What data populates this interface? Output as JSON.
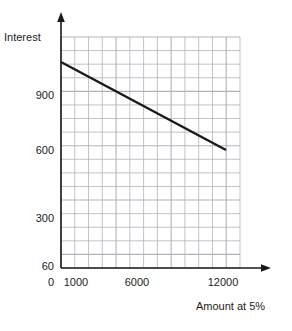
{
  "chart_data": {
    "type": "line",
    "title": "",
    "xlabel": "Amount at 5%",
    "ylabel": "Interest",
    "xlim": [
      0,
      13000
    ],
    "ylim": [
      0,
      1200
    ],
    "grid": true,
    "legend": false,
    "x_ticks": [
      {
        "value": 0,
        "label": "0"
      },
      {
        "value": 1000,
        "label": "1000"
      },
      {
        "value": 6000,
        "label": "6000"
      },
      {
        "value": 12000,
        "label": "12000"
      }
    ],
    "y_ticks": [
      {
        "value": 900,
        "label": "900"
      },
      {
        "value": 600,
        "label": "600"
      },
      {
        "value": 300,
        "label": "300"
      },
      {
        "value": 60,
        "label": "60"
      }
    ],
    "series": [
      {
        "name": "Interest vs Amount",
        "color": "#1a1a1a",
        "x": [
          0,
          12000
        ],
        "values": [
          1080,
          600
        ]
      }
    ],
    "grid_color": "#b2b2bb",
    "axis_color": "#1a1a1a"
  },
  "axes": {
    "y_title": "Interest",
    "x_title": "Amount at 5%"
  },
  "ticks": {
    "y": [
      "900",
      "600",
      "300",
      "60"
    ],
    "x": [
      "0",
      "1000",
      "6000",
      "12000"
    ]
  }
}
